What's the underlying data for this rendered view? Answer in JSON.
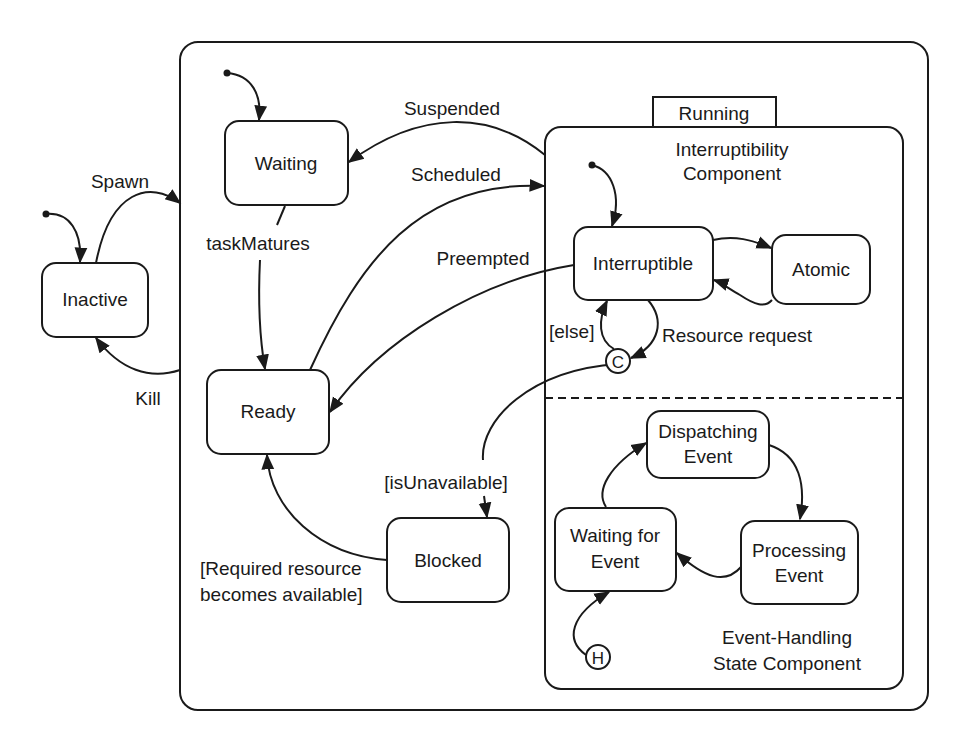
{
  "diagram": {
    "type": "uml-state-machine",
    "composite_states": {
      "task_lifecycle": {
        "label": ""
      },
      "running": {
        "label": "Running"
      }
    },
    "regions": {
      "interruptibility": {
        "line1": "Interruptibility",
        "line2": "Component"
      },
      "event_handling": {
        "line1": "Event-Handling",
        "line2": "State Component"
      }
    },
    "states": {
      "inactive": "Inactive",
      "waiting": "Waiting",
      "ready": "Ready",
      "blocked": "Blocked",
      "interruptible": "Interruptible",
      "atomic": "Atomic",
      "dispatching": {
        "line1": "Dispatching",
        "line2": "Event"
      },
      "processing": {
        "line1": "Processing",
        "line2": "Event"
      },
      "waiting_for_event": {
        "line1": "Waiting for",
        "line2": "Event"
      }
    },
    "pseudostates": {
      "choice": "C",
      "history": "H"
    },
    "transitions": {
      "spawn": "Spawn",
      "kill": "Kill",
      "suspended": "Suspended",
      "scheduled": "Scheduled",
      "preempted": "Preempted",
      "task_matures": "taskMatures",
      "else_guard": "[else]",
      "resource_request": "Resource request",
      "is_unavailable": "[isUnavailable]",
      "resource_available_1": "[Required resource",
      "resource_available_2": "becomes available]"
    }
  }
}
